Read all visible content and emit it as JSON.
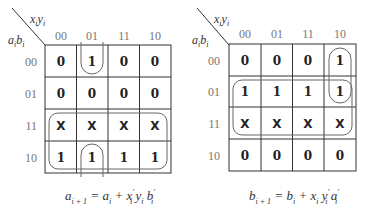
{
  "maps": [
    {
      "id": "a-next",
      "col_var": "x_i y_i",
      "row_var": "a_i b_i",
      "col_headers": [
        "00",
        "01",
        "11",
        "10"
      ],
      "row_headers": [
        "00",
        "01",
        "11",
        "10"
      ],
      "cells": [
        [
          "0",
          "1",
          "0",
          "0"
        ],
        [
          "0",
          "0",
          "0",
          "0"
        ],
        [
          "X",
          "X",
          "X",
          "X"
        ],
        [
          "1",
          "1",
          "1",
          "1"
        ]
      ],
      "groups": [
        "rows 11 and 10 (all columns)",
        "column 01, rows 10 and 00 (wraparound)"
      ],
      "equation": "a_{i+1} = a_i + x'_i y_i b'_i"
    },
    {
      "id": "b-next",
      "col_var": "x_i y_i",
      "row_var": "a_i b_i",
      "col_headers": [
        "00",
        "01",
        "11",
        "10"
      ],
      "row_headers": [
        "00",
        "01",
        "11",
        "10"
      ],
      "cells": [
        [
          "0",
          "0",
          "0",
          "1"
        ],
        [
          "1",
          "1",
          "1",
          "1"
        ],
        [
          "X",
          "X",
          "X",
          "X"
        ],
        [
          "0",
          "0",
          "0",
          "0"
        ]
      ],
      "groups": [
        "rows 01 and 11 (all columns)",
        "column 10, rows 00 and 01"
      ],
      "equation": "b_{i+1} = b_i + x_i y'_i a'_i"
    }
  ]
}
